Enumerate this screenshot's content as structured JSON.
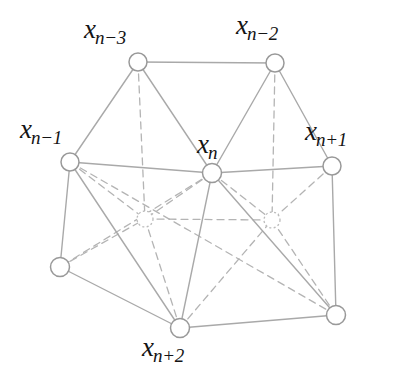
{
  "figure": {
    "kind": "lattice-unit-cell-diagram",
    "background": "#ffffff",
    "width": 411,
    "height": 382,
    "styles": {
      "solid_edge_color": "#a9a9a9",
      "dashed_edge_color": "#b4b4b4",
      "node_stroke_color": "#999999",
      "node_fill_color": "#ffffff",
      "hidden_node_stroke_color": "#bbbbbb",
      "label_color": "#141414",
      "solid_edge_width": 1.4,
      "dashed_edge_width": 1.3,
      "node_radius": 9,
      "hidden_node_radius": 8,
      "dash_pattern": "7 5"
    },
    "nodes": [
      {
        "id": "xn3",
        "label_base": "x",
        "label_sub": "n−3",
        "cx": 138,
        "cy": 62,
        "hidden": false,
        "labelled": true
      },
      {
        "id": "xn2",
        "label_base": "x",
        "label_sub": "n−2",
        "cx": 275,
        "cy": 63,
        "hidden": false,
        "labelled": true
      },
      {
        "id": "xn1",
        "label_base": "x",
        "label_sub": "n−1",
        "cx": 70,
        "cy": 162,
        "hidden": false,
        "labelled": true
      },
      {
        "id": "xn",
        "label_base": "x",
        "label_sub": "n",
        "cx": 212,
        "cy": 173,
        "hidden": false,
        "labelled": true
      },
      {
        "id": "xnp1",
        "label_base": "x",
        "label_sub": "n+1",
        "cx": 332,
        "cy": 166,
        "hidden": false,
        "labelled": true
      },
      {
        "id": "xnp2",
        "label_base": "x",
        "label_sub": "n+2",
        "cx": 180,
        "cy": 328,
        "hidden": false,
        "labelled": true
      },
      {
        "id": "bl",
        "label_base": "",
        "label_sub": "",
        "cx": 60,
        "cy": 267,
        "hidden": false,
        "labelled": false
      },
      {
        "id": "br",
        "label_base": "",
        "label_sub": "",
        "cx": 336,
        "cy": 315,
        "hidden": false,
        "labelled": false
      },
      {
        "id": "hidden1",
        "label_base": "",
        "label_sub": "",
        "cx": 145,
        "cy": 219,
        "hidden": true,
        "labelled": false
      },
      {
        "id": "hidden2",
        "label_base": "",
        "label_sub": "",
        "cx": 272,
        "cy": 220,
        "hidden": true,
        "labelled": false
      }
    ],
    "edges_solid": [
      {
        "from": "xn3",
        "to": "xn2"
      },
      {
        "from": "xn3",
        "to": "xn1"
      },
      {
        "from": "xn3",
        "to": "xn"
      },
      {
        "from": "xn2",
        "to": "xn"
      },
      {
        "from": "xn2",
        "to": "xnp1"
      },
      {
        "from": "xn1",
        "to": "xn"
      },
      {
        "from": "xn",
        "to": "xnp1"
      },
      {
        "from": "xn1",
        "to": "bl"
      },
      {
        "from": "xn1",
        "to": "xnp2"
      },
      {
        "from": "xn",
        "to": "xnp2"
      },
      {
        "from": "xn",
        "to": "br"
      },
      {
        "from": "xnp1",
        "to": "br"
      },
      {
        "from": "bl",
        "to": "xnp2"
      },
      {
        "from": "xnp2",
        "to": "br"
      }
    ],
    "edges_dashed": [
      {
        "from": "xn3",
        "to": "hidden1"
      },
      {
        "from": "xn2",
        "to": "hidden2"
      },
      {
        "from": "hidden1",
        "to": "hidden2"
      },
      {
        "from": "xn1",
        "to": "hidden1"
      },
      {
        "from": "xn",
        "to": "hidden1"
      },
      {
        "from": "bl",
        "to": "hidden1"
      },
      {
        "from": "xnp2",
        "to": "hidden1"
      },
      {
        "from": "xn",
        "to": "hidden2"
      },
      {
        "from": "xnp1",
        "to": "hidden2"
      },
      {
        "from": "xnp2",
        "to": "hidden2"
      },
      {
        "from": "br",
        "to": "hidden2"
      },
      {
        "from": "xn1",
        "to": "br"
      },
      {
        "from": "xn",
        "to": "bl"
      }
    ],
    "labels": {
      "xn3": {
        "base": "x",
        "sub": "n−3"
      },
      "xn2": {
        "base": "x",
        "sub": "n−2"
      },
      "xn1": {
        "base": "x",
        "sub": "n−1"
      },
      "xn": {
        "base": "x",
        "sub": "n"
      },
      "xnp1": {
        "base": "x",
        "sub": "n+1"
      },
      "xnp2": {
        "base": "x",
        "sub": "n+2"
      }
    }
  }
}
